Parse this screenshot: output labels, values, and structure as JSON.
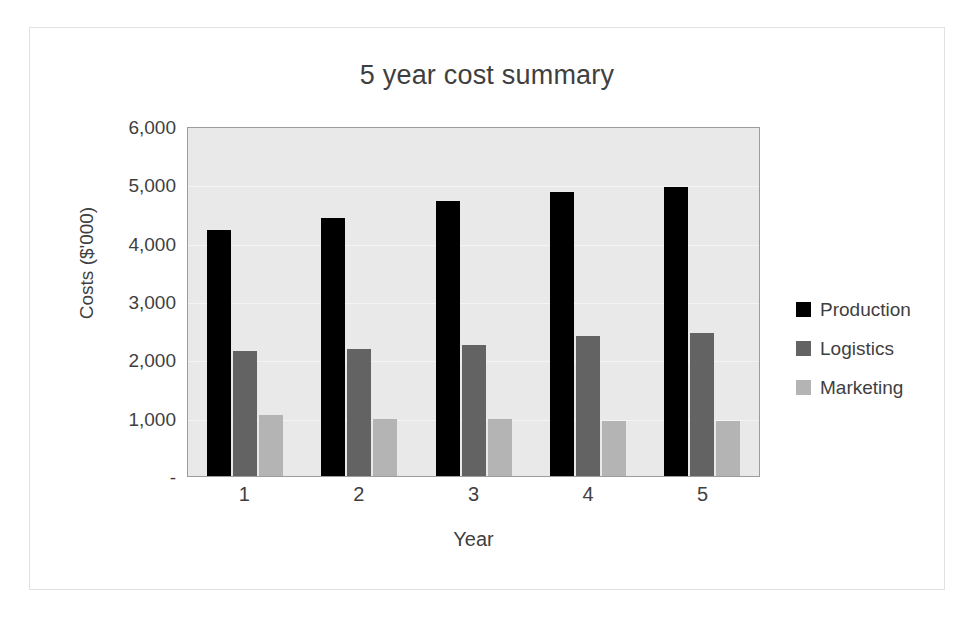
{
  "chart_data": {
    "type": "bar",
    "title": "5 year cost summary",
    "xlabel": "Year",
    "ylabel": "Costs ($'000)",
    "categories": [
      "1",
      "2",
      "3",
      "4",
      "5"
    ],
    "series": [
      {
        "name": "Production",
        "color": "#000000",
        "values": [
          4225,
          4415,
          4710,
          4865,
          4960
        ]
      },
      {
        "name": "Logistics",
        "color": "#636363",
        "values": [
          2140,
          2170,
          2240,
          2400,
          2460
        ]
      },
      {
        "name": "Marketing",
        "color": "#b4b4b4",
        "values": [
          1050,
          985,
          985,
          950,
          950
        ]
      }
    ],
    "ylim": [
      0,
      6000
    ],
    "ytick_values": [
      6000,
      5000,
      4000,
      3000,
      2000,
      1000,
      0
    ],
    "ytick_labels": [
      "6,000",
      "5,000",
      "4,000",
      "3,000",
      "2,000",
      "1,000",
      "-"
    ],
    "grid": true,
    "legend_position": "right",
    "plot_background": "#e9e9e9",
    "chart_background": "#ffffff"
  }
}
